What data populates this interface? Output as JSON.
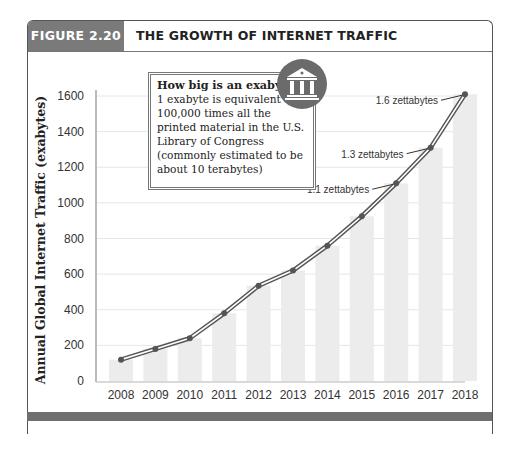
{
  "figure": {
    "number_label": "FIGURE 2.20",
    "title": "THE GROWTH OF INTERNET TRAFFIC"
  },
  "callout": {
    "heading": "How big is an exabyte?",
    "body": "1 exabyte is equivalent to 100,000 times all the printed material in the U.S. Library of Congress (commonly estimated to be about 10 terabytes)",
    "icon": "bank-building-icon"
  },
  "chart_data": {
    "type": "bar",
    "title": "The Growth of Internet Traffic",
    "xlabel": "",
    "ylabel": "Annual Global Internet Traffic (exabytes)",
    "ylim": [
      0,
      1600
    ],
    "yticks": [
      0,
      200,
      400,
      600,
      800,
      1000,
      1200,
      1400,
      1600
    ],
    "grid": true,
    "categories": [
      "2008",
      "2009",
      "2010",
      "2011",
      "2012",
      "2013",
      "2014",
      "2015",
      "2016",
      "2017",
      "2018"
    ],
    "series": [
      {
        "name": "Annual Global Internet Traffic (bars)",
        "type": "bar",
        "values": [
          120,
          180,
          240,
          380,
          535,
          620,
          760,
          925,
          1110,
          1310,
          1610
        ]
      },
      {
        "name": "Trend line",
        "type": "line",
        "values": [
          120,
          180,
          240,
          380,
          535,
          620,
          760,
          925,
          1110,
          1310,
          1610
        ]
      }
    ],
    "annotations": [
      {
        "text": "1.1 zettabytes",
        "x": "2016",
        "y": 1110
      },
      {
        "text": "1.3 zettabytes",
        "x": "2017",
        "y": 1310
      },
      {
        "text": "1.6 zettabytes",
        "x": "2018",
        "y": 1610
      }
    ]
  }
}
